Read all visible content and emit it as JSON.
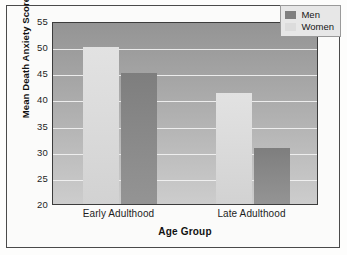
{
  "chart_data": {
    "type": "bar",
    "title": "",
    "xlabel": "Age Group",
    "ylabel": "Mean Death Anxiety Score",
    "categories": [
      "Early Adulthood",
      "Late Adulthood"
    ],
    "series": [
      {
        "name": "Men",
        "values": [
          45.0,
          30.8
        ],
        "color": "#7f7f7f"
      },
      {
        "name": "Women",
        "values": [
          50.0,
          41.3
        ],
        "color": "#dcdcdc"
      }
    ],
    "series_draw_order": [
      "Women",
      "Men"
    ],
    "ylim": [
      20,
      55
    ],
    "yticks": [
      20,
      25,
      30,
      35,
      40,
      45,
      50,
      55
    ],
    "ytick_labels": [
      "20",
      "25",
      "30",
      "35",
      "40",
      "45",
      "50",
      "55"
    ],
    "grid": true,
    "grid_axis": "y",
    "grid_color": "#f2f2f2",
    "legend_position": "top-right",
    "legend_entries": [
      "Men",
      "Women"
    ],
    "plot_background": "vertical gray gradient",
    "plot_bg_top": "#949494",
    "plot_bg_bottom": "#cdcdcd",
    "frame_border_color": "#4a4a4a",
    "page_background": "#fdfdfc"
  }
}
